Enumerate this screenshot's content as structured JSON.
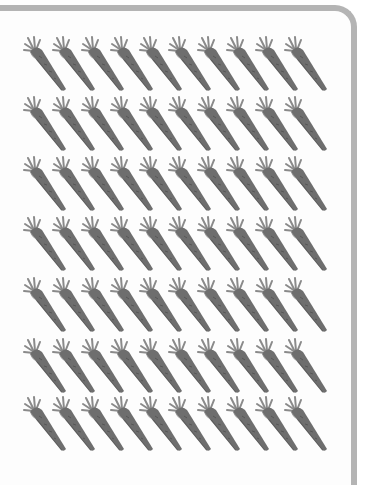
{
  "scene": {
    "description": "Grid of carrots in a rounded-corner frame",
    "rows": 7,
    "carrots_per_row": 10,
    "total_carrots": 70,
    "row_top_positions": [
      36,
      96,
      156,
      216,
      277,
      338,
      396
    ],
    "first_carrot_left": 22,
    "carrot_spacing": 29
  },
  "colors": {
    "frame_border": "#b4b4b4",
    "background": "#fdfdfd",
    "carrot_body": "#6e6e6e",
    "carrot_body_dark": "#4f4f4f",
    "carrot_leaves": "#8a8a8a"
  }
}
